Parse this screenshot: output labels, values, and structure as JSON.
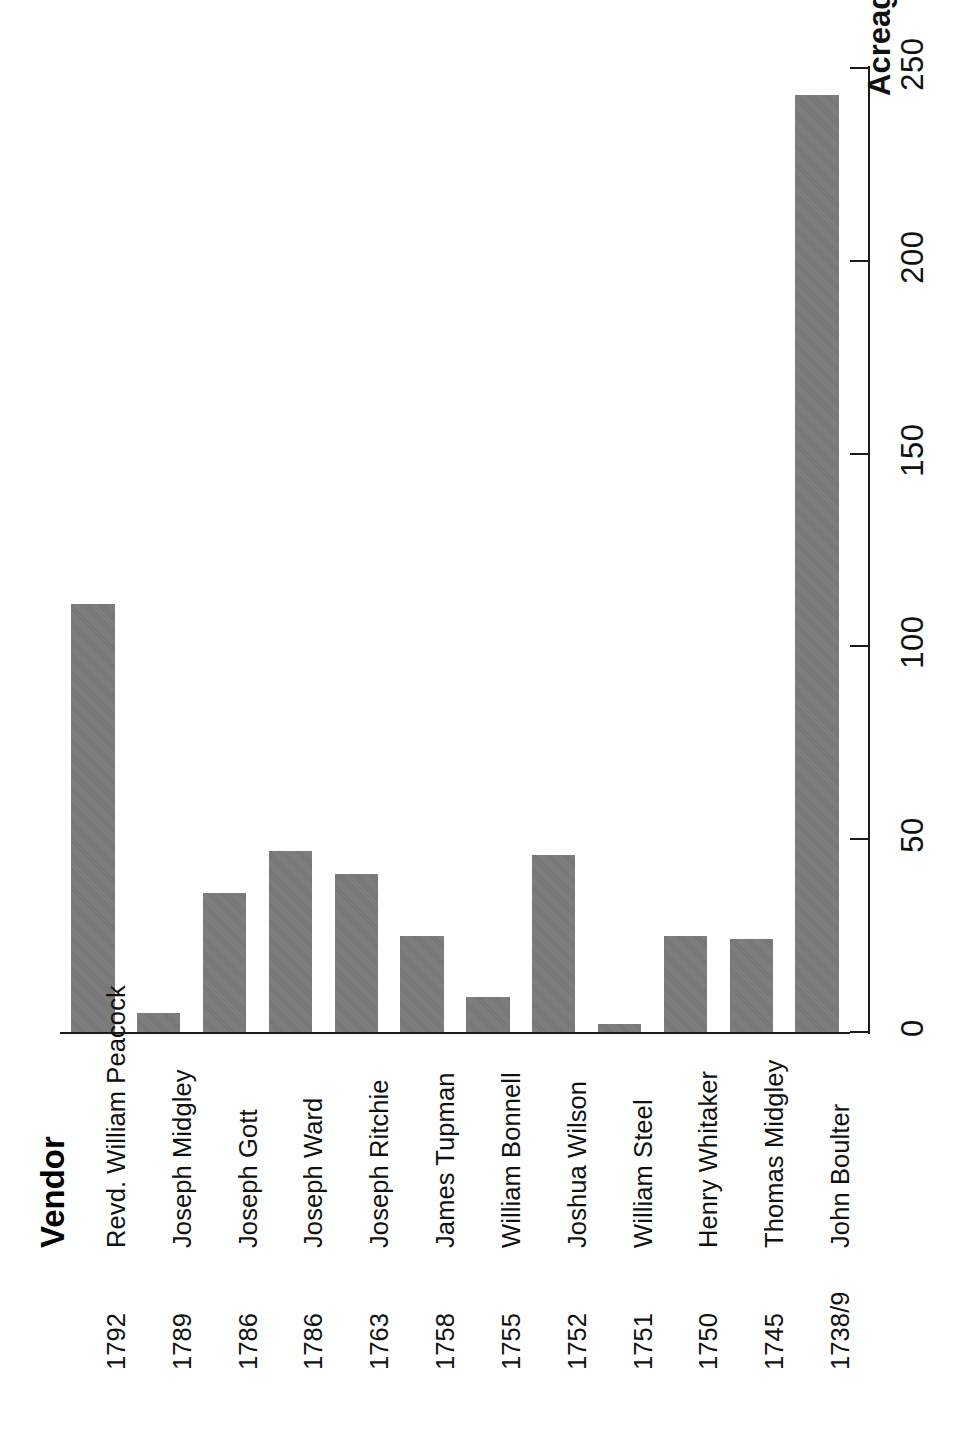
{
  "chart_data": {
    "type": "bar",
    "title": "",
    "orientation": "rotated-90",
    "xlabel": "Vendor",
    "ylabel": "Acreage",
    "categories": [
      "Revd. William Peacock",
      "Joseph Midgley",
      "Joseph Gott",
      "Joseph Ward",
      "Joseph Ritchie",
      "James Tupman",
      "William Bonnell",
      "Joshua Wilson",
      "William Steel",
      "Henry Whitaker",
      "Thomas Midgley",
      "John Boulter"
    ],
    "category_years": [
      "1792",
      "1789",
      "1786",
      "1786",
      "1763",
      "1758",
      "1755",
      "1752",
      "1751",
      "1750",
      "1745",
      "1738/9"
    ],
    "values": [
      111,
      5,
      36,
      47,
      41,
      25,
      9,
      46,
      2,
      25,
      24,
      243
    ],
    "ylim": [
      0,
      250
    ],
    "yticks": [
      0,
      50,
      100,
      150,
      200,
      250
    ],
    "ytick_labels": [
      "0",
      "50",
      "100",
      "150",
      "200",
      "250"
    ],
    "grid": false,
    "legend": false,
    "bar_color": "#7a7a7a",
    "axis_color": "#1a1a1a"
  },
  "axes": {
    "value_axis_title": "Acreage",
    "category_axis_title": "Vendor"
  }
}
